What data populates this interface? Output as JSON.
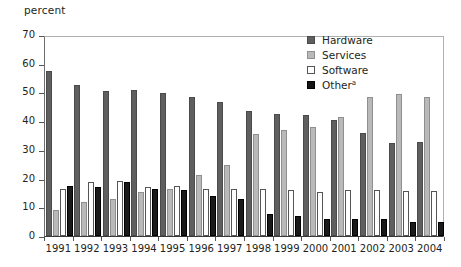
{
  "chart_data": {
    "type": "bar",
    "title": "",
    "ylabel": "percent",
    "xlabel": "",
    "ylim": [
      0,
      70
    ],
    "yticks": [
      0,
      10,
      20,
      30,
      40,
      50,
      60,
      70
    ],
    "grid": false,
    "legend_position": "top-right",
    "categories": [
      "1991",
      "1992",
      "1993",
      "1994",
      "1995",
      "1996",
      "1997",
      "1998",
      "1999",
      "2000",
      "2001",
      "2002",
      "2003",
      "2004"
    ],
    "series": [
      {
        "name": "Hardware",
        "color": "#5f5f5f",
        "values": [
          57.5,
          52.5,
          50.5,
          51.0,
          49.8,
          48.3,
          46.5,
          43.5,
          42.5,
          42.0,
          40.5,
          36.0,
          32.3,
          32.8
        ]
      },
      {
        "name": "Services",
        "color": "#b9b9b9",
        "values": [
          9.0,
          11.8,
          13.0,
          15.5,
          16.5,
          21.3,
          24.8,
          35.5,
          37.0,
          38.0,
          41.3,
          48.5,
          49.5,
          48.5
        ]
      },
      {
        "name": "Software",
        "color": "#ffffff",
        "values": [
          16.5,
          18.8,
          19.2,
          17.2,
          17.5,
          16.5,
          16.5,
          16.5,
          16.0,
          15.5,
          16.0,
          16.0,
          15.8,
          15.8
        ]
      },
      {
        "name": "Other",
        "color": "#1a1a1a",
        "values": [
          17.5,
          17.0,
          18.8,
          16.2,
          16.0,
          14.0,
          13.0,
          7.5,
          7.0,
          6.0,
          5.8,
          5.8,
          5.0,
          5.0
        ]
      }
    ],
    "legend": [
      {
        "label": "Hardware",
        "superscript": ""
      },
      {
        "label": "Services",
        "superscript": ""
      },
      {
        "label": "Software",
        "superscript": ""
      },
      {
        "label": "Other",
        "superscript": "a"
      }
    ]
  }
}
